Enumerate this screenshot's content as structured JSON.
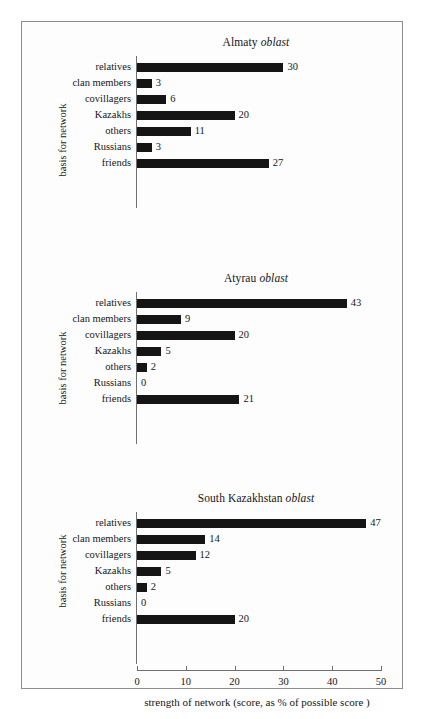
{
  "figure": {
    "ylabel": "basis for network",
    "xlabel": "strength of network (score, as % of possible score )",
    "bar_color": "#151515",
    "axis_color": "#6f6f6f",
    "frame_color": "#8d8d8d",
    "background": "#fdfdfd"
  },
  "chart_data": {
    "type": "bar",
    "title": "",
    "xlabel": "strength of network (score, as % of possible score )",
    "ylabel": "basis for network",
    "xlim": [
      0,
      50
    ],
    "xticks": [
      0,
      10,
      20,
      30,
      40,
      50
    ],
    "xtick_labels": [
      "0",
      "10",
      "20",
      "30",
      "40",
      "50"
    ],
    "grid": false,
    "legend": "none",
    "orientation": "horizontal",
    "categories": [
      "relatives",
      "clan members",
      "covillagers",
      "Kazakhs",
      "others",
      "Russians",
      "friends"
    ],
    "panels": [
      {
        "title_region": "Almaty",
        "title_suffix": "oblast",
        "title_full": "Almaty oblast",
        "values": [
          30,
          3,
          6,
          20,
          11,
          3,
          27
        ],
        "labels": [
          "30",
          "3",
          "6",
          "20",
          "11",
          "3",
          "27"
        ]
      },
      {
        "title_region": "Atyrau",
        "title_suffix": "oblast",
        "title_full": "Atyrau oblast",
        "values": [
          43,
          9,
          20,
          5,
          2,
          0,
          21
        ],
        "labels": [
          "43",
          "9",
          "20",
          "5",
          "2",
          "0",
          "21"
        ]
      },
      {
        "title_region": "South Kazakhstan",
        "title_suffix": "oblast",
        "title_full": "South Kazakhstan oblast",
        "values": [
          47,
          14,
          12,
          5,
          2,
          0,
          20
        ],
        "labels": [
          "47",
          "14",
          "12",
          "5",
          "2",
          "0",
          "20"
        ]
      }
    ]
  }
}
